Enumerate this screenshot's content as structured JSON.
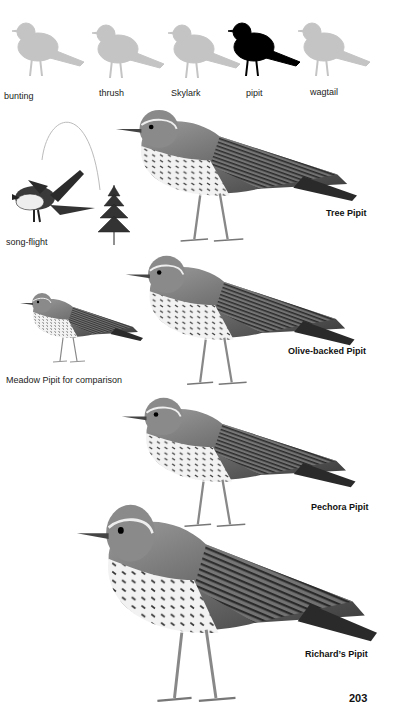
{
  "silhouettes": [
    {
      "label": "bunting",
      "highlighted": false
    },
    {
      "label": "thrush",
      "highlighted": false
    },
    {
      "label": "Skylark",
      "highlighted": false
    },
    {
      "label": "pipit",
      "highlighted": true
    },
    {
      "label": "wagtail",
      "highlighted": false
    }
  ],
  "colors": {
    "silhouette_muted": "#c4c4c4",
    "silhouette_highlight": "#000000",
    "plumage_dark": "#2b2b2b",
    "plumage_mid": "#8a8a8a",
    "plumage_light": "#e6e6e6"
  },
  "illustrations": {
    "song_flight_label": "song-flight",
    "tree_pipit": "Tree Pipit",
    "olive_backed_pipit": "Olive-backed Pipit",
    "meadow_pipit_note": "Meadow Pipit for comparison",
    "pechora_pipit": "Pechora Pipit",
    "richards_pipit": "Richard’s Pipit"
  },
  "page_number": "203"
}
